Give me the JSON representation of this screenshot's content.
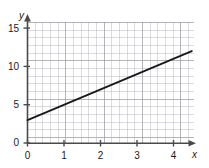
{
  "chart_data": {
    "type": "line",
    "title": "",
    "subtitle": "",
    "xlabel": "x",
    "ylabel": "y",
    "xlim": [
      0,
      4.5
    ],
    "ylim": [
      0,
      16
    ],
    "grid": true,
    "legend": null,
    "x_ticks": [
      "0",
      "1",
      "2",
      "3",
      "4"
    ],
    "x_tick_values": [
      0,
      1,
      2,
      3,
      4
    ],
    "y_ticks": [
      "0",
      "5",
      "10",
      "15"
    ],
    "y_tick_values": [
      0,
      5,
      10,
      15
    ],
    "series": [
      {
        "name": "line",
        "color": "#1a1a1a",
        "equation": "y = 2x + 3",
        "slope": 2,
        "intercept": 3,
        "x": [
          0,
          4.5
        ],
        "values": [
          3,
          12
        ],
        "points": [
          [
            0,
            3
          ],
          [
            1,
            5
          ],
          [
            2,
            7
          ],
          [
            3,
            9
          ],
          [
            4,
            11
          ],
          [
            4.5,
            12
          ]
        ]
      }
    ],
    "axis_arrows": true,
    "line_color": "#1a1a1a",
    "grid_color": "#b9b9c0",
    "axis_color": "#4a4a4a"
  },
  "figure": {
    "background": "#ffffff"
  }
}
